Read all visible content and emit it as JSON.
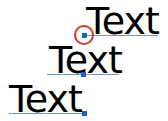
{
  "labels": [
    {
      "text": "Text"
    },
    {
      "text": "Text"
    },
    {
      "text": "Text"
    }
  ],
  "colors": {
    "baseline": "#6f9bd1",
    "marker": "#1f5fb0",
    "highlight_ring": "#cc3a2c",
    "text": "#000000"
  }
}
